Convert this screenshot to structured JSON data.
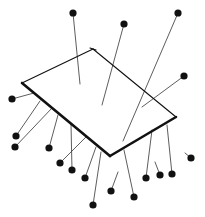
{
  "image": {
    "description": "Ink illustration of a flat rectangular sheet seen in perspective, pierced by many dressmaker pins with round black heads; some pins point up from above the sheet, many hang below it.",
    "colors": {
      "background": "#ffffff",
      "ink": "#111111",
      "pin_shaft": "#333333"
    },
    "sheet": {
      "corners": [
        [
          22,
          83
        ],
        [
          93,
          49
        ],
        [
          176,
          117
        ],
        [
          110,
          156
        ]
      ],
      "thick_edges": [
        [
          [
            22,
            83
          ],
          [
            110,
            156
          ]
        ],
        [
          [
            110,
            156
          ],
          [
            176,
            117
          ]
        ]
      ]
    },
    "pins": [
      {
        "head": [
          73,
          13
        ],
        "tip": [
          80,
          84
        ],
        "side": "above"
      },
      {
        "head": [
          124,
          24
        ],
        "tip": [
          102,
          105
        ],
        "side": "above"
      },
      {
        "head": [
          178,
          13
        ],
        "tip": [
          123,
          141
        ],
        "side": "above"
      },
      {
        "head": [
          184,
          76
        ],
        "tip": [
          142,
          107
        ],
        "side": "above"
      },
      {
        "head": [
          12,
          99
        ],
        "tip": [
          34,
          93
        ],
        "side": "left"
      },
      {
        "head": [
          16,
          136
        ],
        "tip": [
          40,
          101
        ],
        "side": "below"
      },
      {
        "head": [
          15,
          147
        ],
        "tip": [
          52,
          108
        ],
        "side": "below"
      },
      {
        "head": [
          49,
          148
        ],
        "tip": [
          58,
          115
        ],
        "side": "below"
      },
      {
        "head": [
          60,
          163
        ],
        "tip": [
          86,
          137
        ],
        "side": "below"
      },
      {
        "head": [
          72,
          170
        ],
        "tip": [
          71,
          124
        ],
        "side": "below"
      },
      {
        "head": [
          85,
          178
        ],
        "tip": [
          96,
          147
        ],
        "side": "below"
      },
      {
        "head": [
          93,
          205
        ],
        "tip": [
          101,
          152
        ],
        "side": "below"
      },
      {
        "head": [
          111,
          191
        ],
        "tip": [
          118,
          172
        ],
        "side": "below"
      },
      {
        "head": [
          134,
          197
        ],
        "tip": [
          124,
          150
        ],
        "side": "below"
      },
      {
        "head": [
          146,
          178
        ],
        "tip": [
          152,
          130
        ],
        "side": "below"
      },
      {
        "head": [
          160,
          175
        ],
        "tip": [
          155,
          162
        ],
        "side": "below"
      },
      {
        "head": [
          172,
          174
        ],
        "tip": [
          167,
          125
        ],
        "side": "below"
      },
      {
        "head": [
          191,
          158
        ],
        "tip": [
          185,
          153
        ],
        "side": "below"
      }
    ]
  }
}
